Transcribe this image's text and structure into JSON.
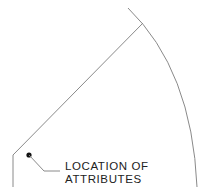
{
  "diagram": {
    "label": {
      "line1": "LOCATION OF",
      "line2": "ATTRIBUTES"
    },
    "colors": {
      "line": "#8a8a8a",
      "dot": "#111111",
      "text": "#222222",
      "background": "#ffffff"
    }
  }
}
